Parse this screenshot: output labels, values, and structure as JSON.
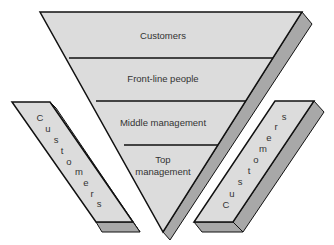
{
  "diagram": {
    "type": "inverted-pyramid",
    "colors": {
      "face": "#dcdcdc",
      "side": "#a8a8a8",
      "edge": "#111111",
      "text": "#333333"
    },
    "pyramid_levels": [
      {
        "label": "Customers"
      },
      {
        "label": "Front-line people"
      },
      {
        "label": "Middle management"
      },
      {
        "label_line1": "Top",
        "label_line2": "management"
      }
    ],
    "left_support": {
      "label": "Customers",
      "letters": [
        "C",
        "u",
        "s",
        "t",
        "o",
        "m",
        "e",
        "r",
        "s"
      ]
    },
    "right_support": {
      "label": "Customers",
      "letters": [
        "C",
        "u",
        "s",
        "t",
        "o",
        "m",
        "e",
        "r",
        "s"
      ]
    }
  }
}
